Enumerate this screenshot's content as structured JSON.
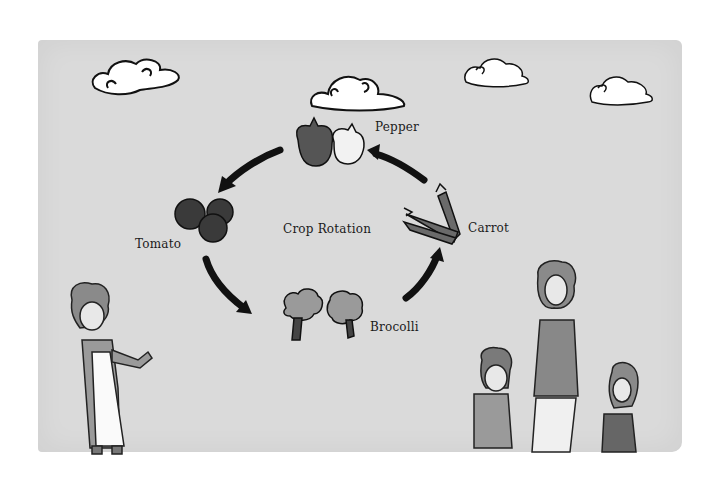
{
  "illustration": {
    "title": "Crop Rotation",
    "crops": [
      {
        "name": "Pepper",
        "icon": "pepper-icon"
      },
      {
        "name": "Carrot",
        "icon": "carrot-icon"
      },
      {
        "name": "Brocolli",
        "icon": "broccoli-icon"
      },
      {
        "name": "Tomato",
        "icon": "tomato-icon"
      }
    ],
    "colors": {
      "background": "#ffffff",
      "paint_wash": "#dadada",
      "ink": "#1a1a1a",
      "crop_fill": "#555555",
      "broccoli_fill": "#9a9a9a",
      "cloud_fill": "#ffffff"
    }
  }
}
